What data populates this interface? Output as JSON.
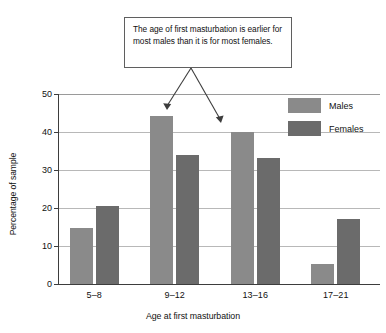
{
  "callout": {
    "text": "The age of first masturbation is earlier for most males than it is for most females.",
    "border_color": "#5f5f5f"
  },
  "legend": {
    "position": "top-right",
    "items": [
      {
        "label": "Males",
        "color": "#8a8a8a"
      },
      {
        "label": "Females",
        "color": "#6b6b6b"
      }
    ]
  },
  "axes": {
    "y_title": "Percentage of sample",
    "x_title": "Age at first masturbation",
    "y_ticks": [
      "0",
      "10",
      "20",
      "30",
      "40",
      "50"
    ],
    "x_ticks": [
      "5–8",
      "9–12",
      "13–16",
      "17–21"
    ]
  },
  "chart_data": {
    "type": "bar",
    "title": "",
    "subtitle": "",
    "xlabel": "Age at first masturbation",
    "ylabel": "Percentage of sample",
    "categories": [
      "5–8",
      "9–12",
      "13–16",
      "17–21"
    ],
    "series": [
      {
        "name": "Males",
        "color": "#8a8a8a",
        "values": [
          14.7,
          44.2,
          40.0,
          5.2
        ]
      },
      {
        "name": "Females",
        "color": "#6b6b6b",
        "values": [
          20.4,
          34.0,
          33.1,
          17.0
        ]
      }
    ],
    "ylim": [
      0,
      50
    ],
    "ytick_step": 10,
    "grid": true,
    "legend_position": "top-right",
    "annotations": [
      {
        "text": "The age of first masturbation is earlier for most males than it is for most females.",
        "points_to": [
          "Males 9–12",
          "Males 13–16"
        ]
      }
    ]
  }
}
